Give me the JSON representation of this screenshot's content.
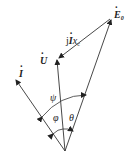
{
  "diagram": {
    "type": "phasor-diagram",
    "origin": {
      "x": 65,
      "y": 151
    },
    "phasors": [
      {
        "id": "E0",
        "label_main": "E",
        "label_sub": "0",
        "dotted": true,
        "tip": {
          "x": 112,
          "y": 18
        }
      },
      {
        "id": "U",
        "label_main": "U",
        "label_sub": "",
        "dotted": true,
        "tip": {
          "x": 57,
          "y": 59
        }
      },
      {
        "id": "I",
        "label_main": "I",
        "label_sub": "",
        "dotted": true,
        "tip": {
          "x": 16,
          "y": 79
        }
      }
    ],
    "voltage_drop": {
      "label_prefix": "j",
      "label_main": "I",
      "label_var": "x",
      "label_sub": "c",
      "from": {
        "x": 112,
        "y": 18
      },
      "to": {
        "x": 57,
        "y": 59
      }
    },
    "angles": [
      {
        "symbol": "ψ",
        "between": [
          "I",
          "E0"
        ]
      },
      {
        "symbol": "φ",
        "between": [
          "I",
          "U"
        ]
      },
      {
        "symbol": "θ",
        "between": [
          "U",
          "E0"
        ]
      }
    ]
  }
}
